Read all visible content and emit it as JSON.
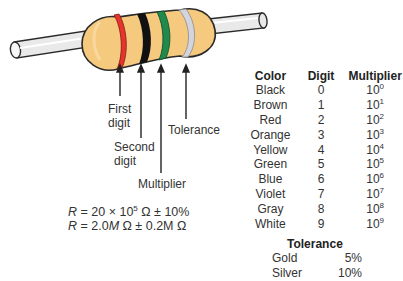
{
  "diagram": {
    "resistor": {
      "body_color": "#f5c97e",
      "lead_color": "#e6e6e6",
      "outline_color": "#2a2a2a",
      "bands": [
        {
          "name": "first-digit",
          "color_name": "Red",
          "hex": "#e8342c"
        },
        {
          "name": "second-digit",
          "color_name": "Black",
          "hex": "#111111"
        },
        {
          "name": "multiplier",
          "color_name": "Green",
          "hex": "#1f8a4c"
        },
        {
          "name": "tolerance",
          "color_name": "Silver",
          "hex": "#d4d4dc"
        }
      ]
    },
    "callouts": {
      "first_digit": [
        "First",
        "digit"
      ],
      "second_digit": [
        "Second",
        "digit"
      ],
      "multiplier": "Multiplier",
      "tolerance": "Tolerance"
    },
    "formulas": {
      "line1": {
        "var": "R",
        "eq": " = 20 × 10",
        "exp": "5",
        "rest": " Ω ± 10%"
      },
      "line2": {
        "var": "R",
        "eq": " = 2.0",
        "unit1": "M",
        "mid": " Ω ± 0.2",
        "unit2": "M",
        "end": " Ω"
      }
    }
  },
  "color_table": {
    "headers": {
      "color": "Color",
      "digit": "Digit",
      "multiplier": "Multiplier"
    },
    "rows": [
      {
        "color": "Black",
        "digit": "0",
        "base": "10",
        "exp": "0"
      },
      {
        "color": "Brown",
        "digit": "1",
        "base": "10",
        "exp": "1"
      },
      {
        "color": "Red",
        "digit": "2",
        "base": "10",
        "exp": "2"
      },
      {
        "color": "Orange",
        "digit": "3",
        "base": "10",
        "exp": "3"
      },
      {
        "color": "Yellow",
        "digit": "4",
        "base": "10",
        "exp": "4"
      },
      {
        "color": "Green",
        "digit": "5",
        "base": "10",
        "exp": "5"
      },
      {
        "color": "Blue",
        "digit": "6",
        "base": "10",
        "exp": "6"
      },
      {
        "color": "Violet",
        "digit": "7",
        "base": "10",
        "exp": "7"
      },
      {
        "color": "Gray",
        "digit": "8",
        "base": "10",
        "exp": "8"
      },
      {
        "color": "White",
        "digit": "9",
        "base": "10",
        "exp": "9"
      }
    ]
  },
  "tolerance_table": {
    "title": "Tolerance",
    "rows": [
      {
        "name": "Gold",
        "value": "5%"
      },
      {
        "name": "Silver",
        "value": "10%"
      }
    ]
  }
}
